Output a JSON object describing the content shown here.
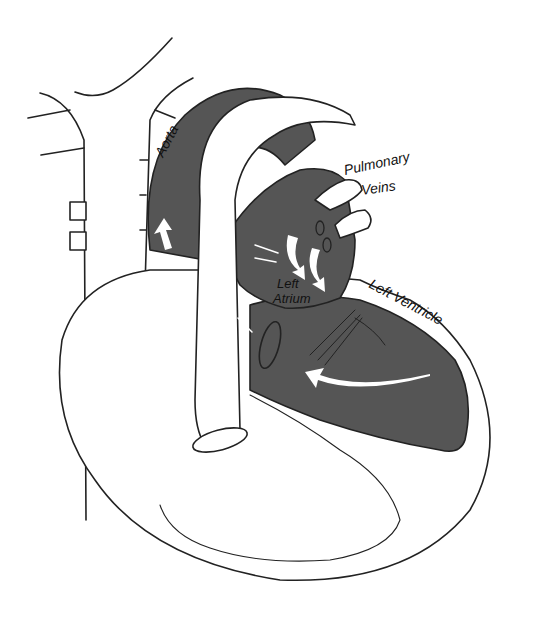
{
  "diagram": {
    "labels": {
      "aorta": "Aorta",
      "pulmonary_veins_line1": "Pulmonary",
      "pulmonary_veins_line2": "Veins",
      "left_atrium_line1": "Left",
      "left_atrium_line2": "Atrium",
      "left_ventricle": "Left Ventricle"
    },
    "colors": {
      "oxygenated_fill": "#555555",
      "outline": "#222222",
      "background": "#ffffff",
      "flow_arrows": "#ffffff"
    }
  }
}
